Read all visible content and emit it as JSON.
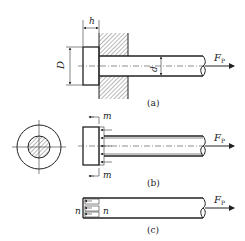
{
  "diagram": {
    "type": "engineering-drawing",
    "figures": [
      {
        "id": "a",
        "caption": "(a)",
        "labels": {
          "head_thickness": "h",
          "head_diameter": "D",
          "shank_diameter": "d",
          "force": "F",
          "force_sub": "P"
        }
      },
      {
        "id": "b",
        "caption": "(b)",
        "labels": {
          "section_top": "m",
          "section_bottom": "m",
          "force": "F",
          "force_sub": "P"
        }
      },
      {
        "id": "c",
        "caption": "(c)",
        "labels": {
          "section_left": "n",
          "section_right": "n",
          "force": "F",
          "force_sub": "P"
        }
      }
    ],
    "colors": {
      "line": "#222222",
      "background": "#ffffff"
    }
  }
}
